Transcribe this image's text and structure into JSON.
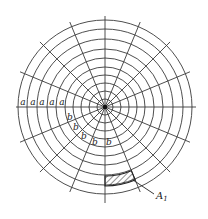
{
  "diagram": {
    "center": [
      105,
      107
    ],
    "ring_count": 10,
    "ring_radii": [
      8,
      16,
      24,
      32,
      40,
      49,
      58,
      68,
      78,
      87
    ],
    "spoke_count": 16,
    "spoke_step_deg": 22.5,
    "spoke_outer_length": 92,
    "horizontal_extent": [
      16,
      196
    ],
    "vertical_extent": [
      16,
      203
    ],
    "stroke_color": "#3a3a3a",
    "labels_a": {
      "text": "a",
      "positions": [
        [
          23,
          105
        ],
        [
          33,
          105
        ],
        [
          42,
          105
        ],
        [
          52,
          105
        ],
        [
          62,
          105
        ]
      ]
    },
    "labels_b": {
      "text": "b",
      "positions": [
        [
          70,
          120
        ],
        [
          76,
          130
        ],
        [
          84,
          139
        ],
        [
          95,
          145
        ],
        [
          109,
          145
        ]
      ]
    },
    "hatched_cell": {
      "inner_radius": 69,
      "outer_radius": 79,
      "start_angle_deg": 90,
      "end_angle_deg": 67.5
    },
    "callout": {
      "label_main": "A",
      "label_sub": "1",
      "leader_from": [
        133,
        180
      ],
      "leader_to": [
        154,
        194
      ],
      "label_pos": [
        156,
        199
      ],
      "sub_pos": [
        163,
        202
      ]
    }
  }
}
